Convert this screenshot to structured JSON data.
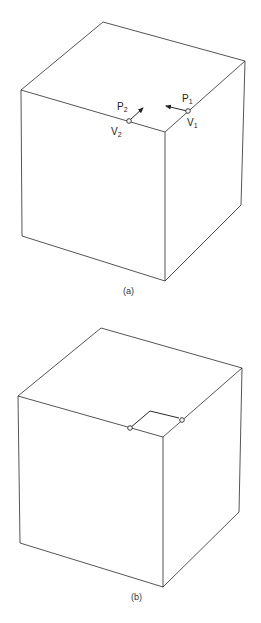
{
  "figure_a": {
    "caption": "(a)",
    "labels": {
      "p1": "P",
      "p1_sub": "1",
      "p2": "P",
      "p2_sub": "2",
      "v1": "V",
      "v1_sub": "1",
      "v2": "V",
      "v2_sub": "2"
    }
  },
  "figure_b": {
    "caption": "(b)"
  }
}
